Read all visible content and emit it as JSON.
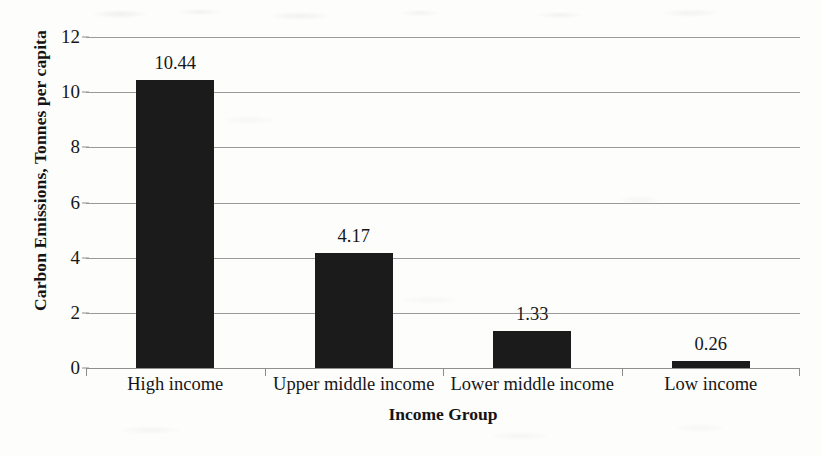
{
  "chart_data": {
    "type": "bar",
    "title": "",
    "subtitle": "",
    "xlabel": "Income Group",
    "ylabel": "Carbon Emissions, Tonnes per capita",
    "categories": [
      "High income",
      "Upper middle income",
      "Lower middle income",
      "Low income"
    ],
    "values": [
      10.44,
      4.17,
      1.33,
      0.26
    ],
    "value_labels": [
      "10.44",
      "4.17",
      "1.33",
      "0.26"
    ],
    "ylim": [
      0,
      12
    ],
    "yticks": [
      0,
      2,
      4,
      6,
      8,
      10,
      12
    ],
    "ytick_labels": [
      "0",
      "2",
      "4",
      "6",
      "8",
      "10",
      "12"
    ],
    "grid": "horizontal",
    "legend": "none",
    "series": [
      {
        "name": "Carbon Emissions",
        "values": [
          10.44,
          4.17,
          1.33,
          0.26
        ]
      }
    ],
    "bar_color": "#1b1b1b",
    "background_color": "#fdfdfc",
    "gridline_color": "#9a9a9a",
    "text_color": "#161616"
  }
}
